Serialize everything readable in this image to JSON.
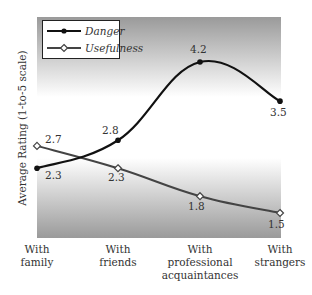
{
  "chart_data": {
    "type": "line",
    "title": "",
    "xlabel": "",
    "ylabel": "Average Rating (1-to-5 scale)",
    "categories": [
      "With family",
      "With friends",
      "With professional acquaintances",
      "With strangers"
    ],
    "category_lines": [
      [
        "With",
        "family"
      ],
      [
        "With",
        "friends"
      ],
      [
        "With",
        "professional",
        "acquaintances"
      ],
      [
        "With",
        "strangers"
      ]
    ],
    "series": [
      {
        "name": "Danger",
        "values": [
          2.3,
          2.8,
          4.2,
          3.5
        ],
        "color": "#111111",
        "marker": "filled-circle",
        "smooth": true
      },
      {
        "name": "Usefulness",
        "values": [
          2.7,
          2.3,
          1.8,
          1.5
        ],
        "color": "#444444",
        "marker": "open-diamond",
        "smooth": true
      }
    ],
    "data_labels": {
      "Danger": [
        "2.3",
        "2.8",
        "4.2",
        "3.5"
      ],
      "Usefulness": [
        "2.7",
        "2.3",
        "1.8",
        "1.5"
      ]
    },
    "ylim": [
      1,
      5
    ],
    "grid": false,
    "legend_position": "top-left-inside",
    "background": "gray gradient bands at top and bottom of plot area"
  }
}
